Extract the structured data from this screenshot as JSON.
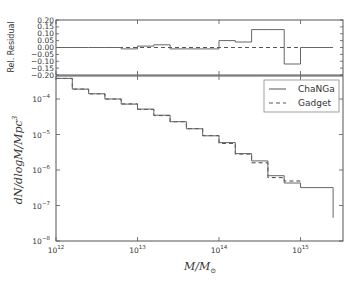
{
  "chart_data": [
    {
      "panel": "residual",
      "type": "line",
      "drawstyle": "steps",
      "ylabel": "Rel. Residual",
      "xlabel": "",
      "xscale": "log",
      "xlim": [
        1000000000000.0,
        3000000000000000.0
      ],
      "ylim": [
        -0.2,
        0.2
      ],
      "yticks": [
        "0.20",
        "0.15",
        "0.10",
        "0.05",
        "0.00",
        "-0.05",
        "-0.10",
        "-0.15",
        "-0.20"
      ],
      "bin_edges_log10": [
        12.0,
        12.2,
        12.4,
        12.6,
        12.8,
        13.0,
        13.2,
        13.4,
        13.6,
        13.8,
        14.0,
        14.2,
        14.4,
        14.6,
        14.8,
        15.0,
        15.4
      ],
      "series": [
        {
          "name": "ChaNGa",
          "style": "solid",
          "values": [
            0.0,
            0.0,
            0.0,
            0.0,
            -0.01,
            0.01,
            0.02,
            -0.01,
            -0.01,
            -0.01,
            0.05,
            0.04,
            0.13,
            0.13,
            -0.12,
            0.0
          ]
        },
        {
          "name": "Gadget",
          "style": "dashed",
          "values": [
            0.0,
            0.0,
            0.0,
            0.0,
            0.0,
            0.0,
            0.0,
            0.0,
            0.0,
            0.0,
            0.0,
            0.0,
            0.0,
            0.0,
            0.0,
            0.0
          ]
        }
      ]
    },
    {
      "panel": "mass_function",
      "type": "line",
      "drawstyle": "steps",
      "xlabel": "M/M_⊙",
      "ylabel": "dN/dlogM/Mpc^3",
      "xscale": "log",
      "yscale": "log",
      "xlim": [
        1000000000000.0,
        3000000000000000.0
      ],
      "ylim": [
        1e-08,
        0.0006
      ],
      "xticks": [
        "10^12",
        "10^13",
        "10^14",
        "10^15"
      ],
      "yticks": [
        "10^-4",
        "10^-5",
        "10^-6",
        "10^-7",
        "10^-8"
      ],
      "legend": {
        "position": "upper right",
        "entries": [
          "ChaNGa",
          "Gadget"
        ]
      },
      "bin_edges_log10": [
        12.0,
        12.2,
        12.4,
        12.6,
        12.8,
        13.0,
        13.2,
        13.4,
        13.6,
        13.8,
        14.0,
        14.2,
        14.4,
        14.6,
        14.8,
        15.0,
        15.4
      ],
      "series": [
        {
          "name": "ChaNGa",
          "style": "solid",
          "values": [
            0.00038,
            0.00019,
            0.00014,
            0.0001,
            7.2e-05,
            5.2e-05,
            3.5e-05,
            2.3e-05,
            1.45e-05,
            9.2e-06,
            5.9e-06,
            2.9e-06,
            1.8e-06,
            6.9e-07,
            4.3e-07,
            3.2e-07,
            4.5e-08
          ]
        },
        {
          "name": "Gadget",
          "style": "dashed",
          "values": [
            0.00038,
            0.00019,
            0.00014,
            0.0001,
            7.3e-05,
            5.1e-05,
            3.4e-05,
            2.3e-05,
            1.47e-05,
            9.3e-06,
            5.6e-06,
            2.8e-06,
            1.6e-06,
            6.1e-07,
            4.9e-07,
            3.2e-07,
            4.5e-08
          ]
        }
      ]
    }
  ],
  "labels": {
    "residual_ylabel": "Rel. Residual",
    "legend_changa": "ChaNGa",
    "legend_gadget": "Gadget",
    "xlabel": "M/M",
    "xlabel_sub": "⊙",
    "ylabel": "dN/dlogM/Mpc"
  }
}
